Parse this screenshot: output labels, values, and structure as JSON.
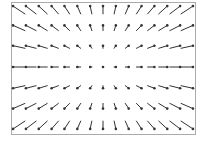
{
  "chart_data": {
    "type": "quiver",
    "title": "",
    "xlabel": "",
    "ylabel": "",
    "grid": false,
    "legend": null,
    "frame": {
      "left": 11,
      "top": 2,
      "right": 195,
      "bottom": 134,
      "color": "#aaaaaa"
    },
    "x": [
      -7,
      -6,
      -5,
      -4,
      -3,
      -2,
      -1,
      0,
      1,
      2,
      3,
      4,
      5,
      6,
      7
    ],
    "y": [
      3,
      2,
      1,
      0,
      -1,
      -2,
      -3
    ],
    "field": "u = x, v = y (radial, pointing away from center)",
    "u_scale_px": 1.7,
    "v_scale_px": 2.6,
    "pixel_x": [
      19,
      31,
      43,
      55,
      67,
      79,
      91,
      103,
      115,
      127,
      139,
      151,
      163,
      175,
      187
    ],
    "pixel_y": [
      10,
      28,
      47,
      67,
      87,
      106,
      125
    ],
    "arrow_color": "#333333"
  }
}
